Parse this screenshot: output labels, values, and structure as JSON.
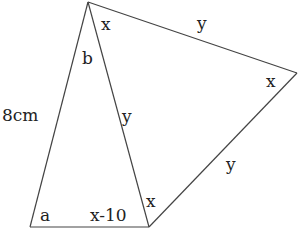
{
  "diagram": {
    "type": "geometry",
    "vertices": {
      "top": [
        88,
        2
      ],
      "bottom_left": [
        30,
        227
      ],
      "bottom_right": [
        149,
        227
      ],
      "right": [
        297,
        73
      ]
    },
    "edges": [
      {
        "id": "left-side",
        "from": "top",
        "to": "bottom_left",
        "label": "8cm"
      },
      {
        "id": "bottom-side",
        "from": "bottom_left",
        "to": "bottom_right"
      },
      {
        "id": "shared-side",
        "from": "top",
        "to": "bottom_right",
        "label": "y"
      },
      {
        "id": "top-right-side",
        "from": "top",
        "to": "right",
        "label": "y"
      },
      {
        "id": "lower-right-side",
        "from": "bottom_right",
        "to": "right",
        "label": "y"
      }
    ],
    "labels": {
      "angle_top_right": "x",
      "angle_top_left": "b",
      "side_top_right": "y",
      "angle_right": "x",
      "side_left": "8cm",
      "side_shared": "y",
      "side_lower_right": "y",
      "angle_bottom_left": "a",
      "angle_bottom_right_inner": "x-10",
      "angle_bottom_right_outer": "x"
    },
    "colors": {
      "line": "#444444",
      "text": "#222222",
      "background": "#ffffff"
    }
  }
}
